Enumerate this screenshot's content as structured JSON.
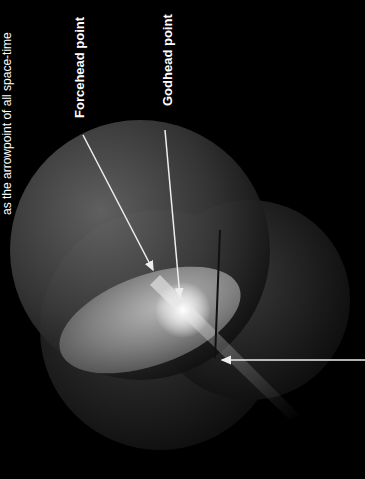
{
  "caption": "as the arrowpoint of all space-time",
  "labels": {
    "forcehead": "Forcehead point",
    "godhead": "Godhead point"
  },
  "colors": {
    "background": "#000000",
    "text": "#ffffff",
    "arrow": "#eeeeee"
  }
}
